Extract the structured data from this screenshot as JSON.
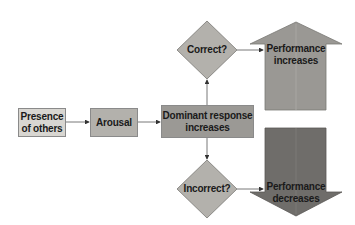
{
  "diagram": {
    "nodes": {
      "presence": {
        "label_line1": "Presence",
        "label_line2": "of others",
        "color": "#d8d6d1"
      },
      "arousal": {
        "label": "Arousal",
        "color": "#b3b1ac"
      },
      "dominant": {
        "label_line1": "Dominant response",
        "label_line2": "increases",
        "color": "#9b9995"
      },
      "correct": {
        "label": "Correct?",
        "color": "#b3b1ac"
      },
      "incorrect": {
        "label": "Incorrect?",
        "color": "#b3b1ac"
      },
      "perf_up": {
        "label_line1": "Performance",
        "label_line2": "increases",
        "color": "#9a9894"
      },
      "perf_down": {
        "label_line1": "Performance",
        "label_line2": "decreases",
        "color": "#6f6d6a"
      }
    },
    "edges": [
      {
        "from": "presence",
        "to": "arousal"
      },
      {
        "from": "arousal",
        "to": "dominant"
      },
      {
        "from": "dominant",
        "to": "correct"
      },
      {
        "from": "dominant",
        "to": "incorrect"
      },
      {
        "from": "correct",
        "to": "perf_up"
      },
      {
        "from": "incorrect",
        "to": "perf_down"
      }
    ],
    "line_color": "#555555"
  }
}
